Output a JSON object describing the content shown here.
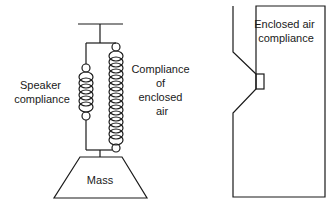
{
  "left_diagram": {
    "title": "Mechanical model",
    "speaker_label": [
      "Speaker",
      "compliance"
    ],
    "enclosed_label": [
      "Compliance",
      "of",
      "enclosed",
      "air"
    ],
    "mass_label": "Mass"
  },
  "right_diagram": {
    "title": "Enclosure cross-section",
    "label": [
      "Enclosed air",
      "compliance"
    ]
  },
  "colors": {
    "line": "#1a1a1a",
    "background": "#ffffff"
  }
}
